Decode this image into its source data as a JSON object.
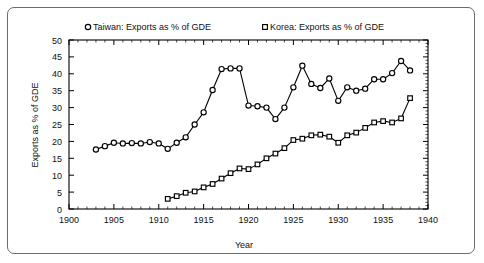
{
  "chart_data": {
    "type": "line",
    "title": "",
    "xlabel": "Year",
    "ylabel": "Exports as % of GDE",
    "xlim": [
      1900,
      1940
    ],
    "ylim": [
      0,
      50
    ],
    "xticks": [
      1900,
      1905,
      1910,
      1915,
      1920,
      1925,
      1930,
      1935,
      1940
    ],
    "yticks": [
      0,
      5,
      10,
      15,
      20,
      25,
      30,
      35,
      40,
      45,
      50
    ],
    "xtick_labels": [
      "1900",
      "1905",
      "1910",
      "1915",
      "1920",
      "1925",
      "1930",
      "1935",
      "1940"
    ],
    "ytick_labels": [
      "0",
      "5",
      "10",
      "15",
      "20",
      "25",
      "30",
      "35",
      "40",
      "45",
      "50"
    ],
    "grid": false,
    "minor_ticks": true,
    "legend_position": "top",
    "frame": true,
    "series": [
      {
        "name": "Taiwan: Exports as % of GDE",
        "marker": "circle-open",
        "color": "#000000",
        "x": [
          1903,
          1904,
          1905,
          1906,
          1907,
          1908,
          1909,
          1910,
          1911,
          1912,
          1913,
          1914,
          1915,
          1916,
          1917,
          1918,
          1919,
          1920,
          1921,
          1922,
          1923,
          1924,
          1925,
          1926,
          1927,
          1928,
          1929,
          1930,
          1931,
          1932,
          1933,
          1934,
          1935,
          1936,
          1937,
          1938
        ],
        "values": [
          17.6,
          18.6,
          19.6,
          19.4,
          19.5,
          19.4,
          19.8,
          19.4,
          17.8,
          19.6,
          21.2,
          25.0,
          28.6,
          35.2,
          41.4,
          41.6,
          41.6,
          30.6,
          30.4,
          30.0,
          26.6,
          30.0,
          36.0,
          42.4,
          37.0,
          35.8,
          38.6,
          32.0,
          36.0,
          35.0,
          35.6,
          38.4,
          38.4,
          40.2,
          43.8,
          41.0
        ]
      },
      {
        "name": "Korea: Exports as % of GDE",
        "marker": "square-open",
        "color": "#000000",
        "x": [
          1911,
          1912,
          1913,
          1914,
          1915,
          1916,
          1917,
          1918,
          1919,
          1920,
          1921,
          1922,
          1923,
          1924,
          1925,
          1926,
          1927,
          1928,
          1929,
          1930,
          1931,
          1932,
          1933,
          1934,
          1935,
          1936,
          1937,
          1938
        ],
        "values": [
          3.0,
          3.8,
          4.8,
          5.2,
          6.4,
          7.4,
          9.0,
          10.6,
          12.0,
          11.8,
          13.2,
          15.0,
          16.4,
          18.0,
          20.4,
          20.8,
          21.8,
          22.0,
          21.4,
          19.6,
          21.8,
          22.6,
          24.0,
          25.6,
          26.0,
          25.6,
          26.8,
          32.8
        ]
      }
    ]
  },
  "legend": {
    "items": [
      {
        "label": "Taiwan: Exports as % of GDE",
        "marker": "circle-open"
      },
      {
        "label": "Korea: Exports as % of GDE",
        "marker": "square-open"
      }
    ]
  },
  "colors": {
    "ink": "#000000",
    "frame": "#6b6b6b",
    "background": "#ffffff"
  }
}
